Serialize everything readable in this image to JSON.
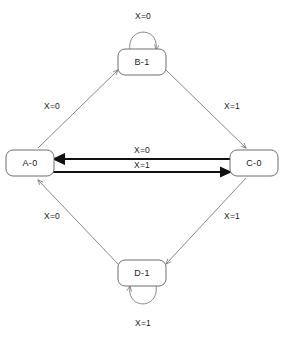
{
  "diagram": {
    "type": "state-transition-diagram",
    "title": "",
    "input_variable": "X",
    "layout": "diamond",
    "colors": {
      "background": "#ffffff",
      "node_stroke": "#6f6f6f",
      "node_fill": "#ffffff",
      "thin_edge": "#7a7a7a",
      "bold_edge": "#111111",
      "text": "#1a1a1a"
    },
    "states": [
      {
        "id": "A",
        "label": "A-0",
        "output": "0",
        "position": "left",
        "cx": 30,
        "cy": 163
      },
      {
        "id": "B",
        "label": "B-1",
        "output": "1",
        "position": "top",
        "cx": 142,
        "cy": 62
      },
      {
        "id": "C",
        "label": "C-0",
        "output": "0",
        "position": "right",
        "cx": 254,
        "cy": 163
      },
      {
        "id": "D",
        "label": "D-1",
        "output": "1",
        "position": "bottom",
        "cx": 142,
        "cy": 273
      }
    ],
    "transitions": [
      {
        "from": "A",
        "to": "B",
        "label": "X=0",
        "style": "thin",
        "shape": "diagonal",
        "label_x": 52,
        "label_y": 107
      },
      {
        "from": "B",
        "to": "C",
        "label": "X=1",
        "style": "thin",
        "shape": "diagonal",
        "label_x": 232,
        "label_y": 107
      },
      {
        "from": "C",
        "to": "D",
        "label": "X=1",
        "style": "thin",
        "shape": "diagonal",
        "label_x": 232,
        "label_y": 217
      },
      {
        "from": "D",
        "to": "A",
        "label": "X=0",
        "style": "thin",
        "shape": "diagonal",
        "label_x": 52,
        "label_y": 217
      },
      {
        "from": "C",
        "to": "A",
        "label": "X=0",
        "style": "bold",
        "shape": "horizontal-upper",
        "label_x": 142,
        "label_y": 152
      },
      {
        "from": "A",
        "to": "C",
        "label": "X=1",
        "style": "bold",
        "shape": "horizontal-lower",
        "label_x": 142,
        "label_y": 174
      },
      {
        "from": "B",
        "to": "B",
        "label": "X=0",
        "style": "thin",
        "shape": "self-loop-top",
        "label_x": 143,
        "label_y": 17
      },
      {
        "from": "D",
        "to": "D",
        "label": "X=1",
        "style": "thin",
        "shape": "self-loop-bottom",
        "label_x": 143,
        "label_y": 324
      }
    ]
  }
}
